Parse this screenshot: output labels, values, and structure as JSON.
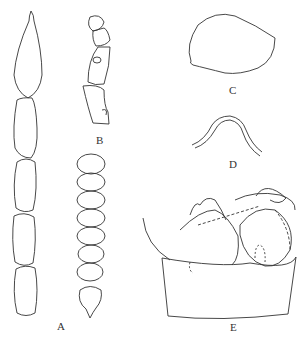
{
  "figure": {
    "panels": [
      {
        "label": "A",
        "description": "antenna, elongated segments"
      },
      {
        "label": "B",
        "description": "maxillary palp"
      },
      {
        "label": "C",
        "description": "spermatheca"
      },
      {
        "label": "D",
        "description": "median lobe apex"
      },
      {
        "label": "E",
        "description": "male genitalia, lateral view"
      }
    ],
    "labels": {
      "a": "A",
      "b": "B",
      "c": "C",
      "d": "D",
      "e": "E"
    }
  }
}
